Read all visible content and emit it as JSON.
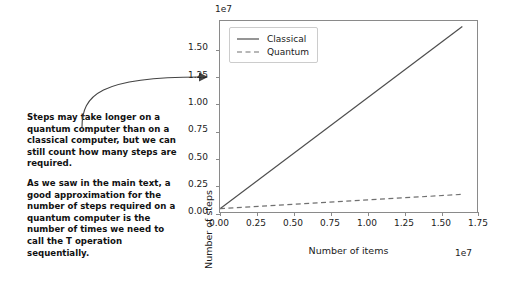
{
  "annotation": {
    "paragraphs": [
      "Steps may take longer on a quantum computer than on a classical computer, but we can still count how many steps are required.",
      "As we saw in the main text, a good approximation for the number of steps required on a quantum computer is the number of times we need to call the T operation sequentially."
    ],
    "arrow_icon": "curved-arrow-icon"
  },
  "chart_data": {
    "type": "line",
    "title": "",
    "xlabel": "Number of items",
    "ylabel": "Number of steps",
    "x_offset_text": "1e7",
    "y_offset_text": "1e7",
    "xlim": [
      0,
      17500000
    ],
    "ylim": [
      -300000,
      17000000
    ],
    "xticks": [
      0,
      2500000,
      5000000,
      7500000,
      10000000,
      12500000,
      15000000,
      17500000
    ],
    "xticklabels": [
      "0.00",
      "0.25",
      "0.50",
      "0.75",
      "1.00",
      "1.25",
      "1.50",
      "1.75"
    ],
    "yticks": [
      0,
      2500000,
      5000000,
      7500000,
      10000000,
      12500000,
      15000000
    ],
    "yticklabels": [
      "0.00",
      "0.25",
      "0.50",
      "0.75",
      "1.00",
      "1.25",
      "1.50"
    ],
    "grid": false,
    "legend_position": "upper left",
    "series": [
      {
        "name": "Classical",
        "style": "solid",
        "color": "#4d4d4d",
        "x": [
          0,
          16500000
        ],
        "values": [
          0,
          16500000
        ]
      },
      {
        "name": "Quantum",
        "style": "dashed",
        "color": "#707070",
        "x": [
          0,
          16500000
        ],
        "values": [
          0,
          1300000
        ]
      }
    ]
  },
  "colors": {
    "classical": "#4d4d4d",
    "quantum": "#707070",
    "frame": "#8a8a8a",
    "text": "#1a1a1a"
  }
}
